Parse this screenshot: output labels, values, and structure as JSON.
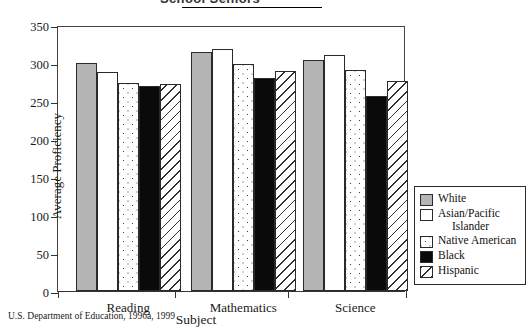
{
  "title": "School Seniors",
  "footnote": "U.S. Department of Education, 1996a, 1999",
  "axis": {
    "ylabel": "Average Proficiency",
    "xlabel": "Subject",
    "yticks": [
      "350",
      "300",
      "250",
      "200",
      "150",
      "100",
      "50",
      "0"
    ]
  },
  "legend": {
    "items": [
      {
        "label": "White",
        "label_cont": "",
        "swatch": "solid-gray-swatch",
        "color": "#b4b4b4"
      },
      {
        "label": "Asian/Pacific",
        "label_cont": "Islander",
        "swatch": "white-swatch",
        "color": "#ffffff"
      },
      {
        "label": "Native American",
        "label_cont": "",
        "swatch": "dotted-swatch",
        "color": "#ffffff"
      },
      {
        "label": "Black",
        "label_cont": "",
        "swatch": "solid-black-swatch",
        "color": "#0a0a0a"
      },
      {
        "label": "Hispanic",
        "label_cont": "",
        "swatch": "diagonal-hatch-swatch",
        "color": "#ffffff"
      }
    ]
  },
  "chart_data": {
    "type": "bar",
    "title": "School Seniors",
    "xlabel": "Subject",
    "ylabel": "Average Proficiency",
    "ylim": [
      0,
      350
    ],
    "ytick_step": 50,
    "grid": false,
    "legend_position": "right",
    "categories": [
      "Reading",
      "Mathematics",
      "Science"
    ],
    "series": [
      {
        "name": "White",
        "values": [
          300,
          315,
          304
        ]
      },
      {
        "name": "Asian/Pacific Islander",
        "values": [
          288,
          319,
          310
        ]
      },
      {
        "name": "Native American",
        "values": [
          274,
          299,
          291
        ]
      },
      {
        "name": "Black",
        "values": [
          270,
          280,
          256
        ]
      },
      {
        "name": "Hispanic",
        "values": [
          273,
          290,
          276
        ]
      }
    ]
  }
}
